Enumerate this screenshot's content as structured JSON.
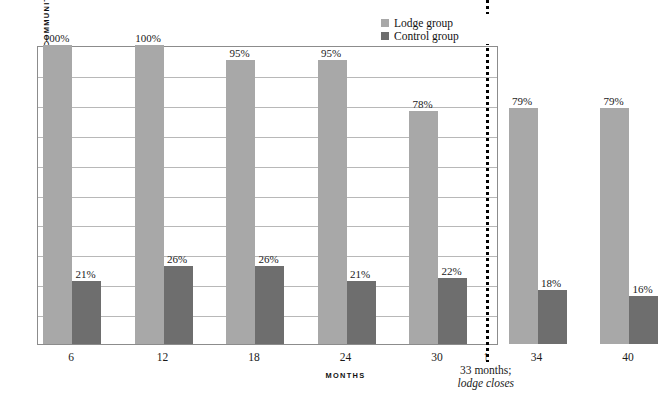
{
  "chart_data": {
    "type": "bar",
    "title": "",
    "xlabel": "MONTHS",
    "ylabel": "MEDIAN PERCENTAGE OF TIME IN COMMUNITY",
    "categories": [
      "6",
      "12",
      "18",
      "24",
      "30",
      "34",
      "40"
    ],
    "ylim": [
      0,
      100
    ],
    "grid": true,
    "gridline_interval": 10,
    "y_tick_labels_shown": false,
    "legend_position": "top-right",
    "series": [
      {
        "name": "Lodge group",
        "color": "#a8a8a8",
        "values": [
          100,
          100,
          95,
          95,
          78,
          79,
          79
        ],
        "labels": [
          "100%",
          "100%",
          "95%",
          "95%",
          "78%",
          "79%",
          "79%"
        ]
      },
      {
        "name": "Control group",
        "color": "#6e6e6e",
        "values": [
          21,
          26,
          26,
          21,
          22,
          18,
          16
        ],
        "labels": [
          "21%",
          "26%",
          "26%",
          "21%",
          "22%",
          "18%",
          "16%"
        ]
      }
    ],
    "annotations": [
      {
        "name": "lodge-closes-marker",
        "line_1": "33 months;",
        "line_2": "lodge closes",
        "arrow": "↑",
        "at_category_gap": "between 30 and 34",
        "line_style": "dotted-vertical"
      }
    ]
  },
  "legend": {
    "items": [
      {
        "label": "Lodge group",
        "color": "#a8a8a8"
      },
      {
        "label": "Control group",
        "color": "#6e6e6e"
      }
    ]
  },
  "axes": {
    "y_title": "MEDIAN PERCENTAGE OF TIME IN COMMUNITY",
    "x_title": "MONTHS",
    "x_ticks": [
      "6",
      "12",
      "18",
      "24",
      "30",
      "34",
      "40"
    ]
  },
  "annotation": {
    "arrow_glyph": "↑",
    "line_1": "33 months;",
    "line_2": "lodge closes"
  }
}
